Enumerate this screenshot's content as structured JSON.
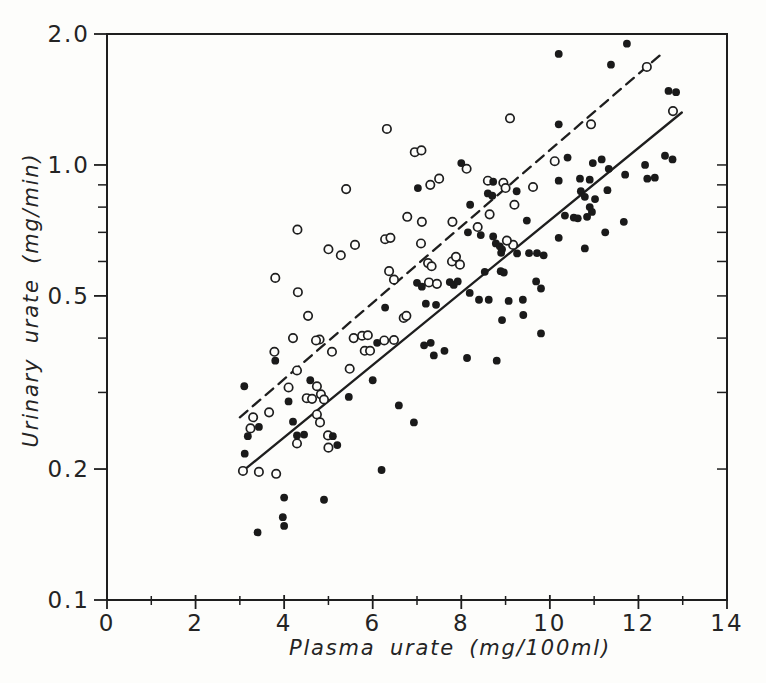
{
  "figure": {
    "background": "#fdfdfb",
    "ink": "#1e1e1e",
    "marker_fill": "#1a1a1a",
    "open_marker_fill": "#fdfdfb"
  },
  "chart_data": {
    "type": "scatter",
    "title": "",
    "xlabel": "Plasma urate (mg/100ml)",
    "ylabel": "Urinary urate (mg/min)",
    "xlim": [
      0,
      14
    ],
    "ylim": [
      0.1,
      2.0
    ],
    "y_scale": "log",
    "grid": "off",
    "legend": "none",
    "x_major_ticks": [
      {
        "value": 0,
        "label": "0"
      },
      {
        "value": 2,
        "label": "2"
      },
      {
        "value": 4,
        "label": "4"
      },
      {
        "value": 6,
        "label": "6"
      },
      {
        "value": 8,
        "label": "8"
      },
      {
        "value": 10,
        "label": "10"
      },
      {
        "value": 12,
        "label": "12"
      },
      {
        "value": 14,
        "label": "14"
      }
    ],
    "x_minor_ticks": [
      1,
      3,
      5,
      7,
      9,
      11,
      13
    ],
    "y_major_ticks": [
      {
        "value": 2.0,
        "label": "2.0"
      },
      {
        "value": 1.0,
        "label": "1.0"
      },
      {
        "value": 0.5,
        "label": "0.5"
      },
      {
        "value": 0.2,
        "label": "0.2"
      },
      {
        "value": 0.1,
        "label": "0.1"
      }
    ],
    "y_minor_ticks": [
      0.9,
      0.8,
      0.7,
      0.6,
      0.4,
      0.3
    ],
    "y_right_ticks": [
      1.0,
      0.9,
      0.8,
      0.7,
      0.6,
      0.5,
      0.4,
      0.3,
      0.2
    ],
    "lines": [
      {
        "name": "dashed-fit-line",
        "style": "dashed",
        "x1": 3.0,
        "y1": 0.263,
        "x2": 12.55,
        "y2": 1.81
      },
      {
        "name": "solid-fit-line",
        "style": "solid",
        "x1": 3.07,
        "y1": 0.198,
        "x2": 12.98,
        "y2": 1.32
      }
    ],
    "series": [
      {
        "name": "open-circles",
        "marker": "open",
        "points": [
          [
            4.3,
            0.71
          ],
          [
            3.8,
            0.55
          ],
          [
            4.31,
            0.51
          ],
          [
            4.54,
            0.45
          ],
          [
            9.1,
            1.28
          ],
          [
            6.32,
            1.21
          ],
          [
            6.95,
            1.07
          ],
          [
            7.1,
            1.08
          ],
          [
            8.12,
            0.98
          ],
          [
            7.5,
            0.93
          ],
          [
            7.3,
            0.9
          ],
          [
            5.4,
            0.88
          ],
          [
            8.6,
            0.92
          ],
          [
            8.95,
            0.91
          ],
          [
            9.0,
            0.885
          ],
          [
            9.62,
            0.89
          ],
          [
            10.11,
            1.02
          ],
          [
            10.93,
            1.24
          ],
          [
            12.19,
            1.68
          ],
          [
            12.78,
            1.33
          ],
          [
            9.2,
            0.81
          ],
          [
            6.78,
            0.76
          ],
          [
            8.64,
            0.77
          ],
          [
            7.11,
            0.74
          ],
          [
            7.8,
            0.74
          ],
          [
            8.37,
            0.72
          ],
          [
            5.0,
            0.64
          ],
          [
            5.28,
            0.62
          ],
          [
            5.6,
            0.655
          ],
          [
            6.28,
            0.675
          ],
          [
            6.4,
            0.68
          ],
          [
            7.09,
            0.66
          ],
          [
            9.17,
            0.655
          ],
          [
            9.03,
            0.67
          ],
          [
            7.79,
            0.6
          ],
          [
            7.88,
            0.615
          ],
          [
            7.97,
            0.59
          ],
          [
            7.25,
            0.595
          ],
          [
            7.33,
            0.585
          ],
          [
            6.37,
            0.57
          ],
          [
            6.48,
            0.545
          ],
          [
            7.27,
            0.537
          ],
          [
            7.45,
            0.533
          ],
          [
            6.7,
            0.445
          ],
          [
            6.76,
            0.45
          ],
          [
            5.57,
            0.4
          ],
          [
            5.76,
            0.405
          ],
          [
            5.89,
            0.406
          ],
          [
            6.26,
            0.395
          ],
          [
            6.48,
            0.396
          ],
          [
            4.8,
            0.397
          ],
          [
            5.08,
            0.372
          ],
          [
            5.82,
            0.374
          ],
          [
            5.94,
            0.374
          ],
          [
            5.48,
            0.34
          ],
          [
            4.74,
            0.31
          ],
          [
            4.83,
            0.297
          ],
          [
            4.9,
            0.289
          ],
          [
            4.74,
            0.267
          ],
          [
            4.81,
            0.256
          ],
          [
            4.99,
            0.239
          ],
          [
            5.0,
            0.224
          ],
          [
            4.2,
            0.4
          ],
          [
            4.72,
            0.395
          ],
          [
            3.78,
            0.372
          ],
          [
            4.29,
            0.337
          ],
          [
            4.1,
            0.308
          ],
          [
            4.51,
            0.291
          ],
          [
            4.63,
            0.29
          ],
          [
            3.3,
            0.263
          ],
          [
            3.66,
            0.27
          ],
          [
            3.24,
            0.248
          ],
          [
            4.29,
            0.229
          ],
          [
            3.07,
            0.198
          ],
          [
            3.43,
            0.197
          ],
          [
            3.82,
            0.195
          ]
        ]
      },
      {
        "name": "filled-circles",
        "marker": "filled",
        "points": [
          [
            10.2,
            1.8
          ],
          [
            11.74,
            1.9
          ],
          [
            11.38,
            1.7
          ],
          [
            12.68,
            1.48
          ],
          [
            12.85,
            1.47
          ],
          [
            10.2,
            1.24
          ],
          [
            8.0,
            1.01
          ],
          [
            10.4,
            1.04
          ],
          [
            10.97,
            1.01
          ],
          [
            11.17,
            1.03
          ],
          [
            11.33,
            0.98
          ],
          [
            12.15,
            1.0
          ],
          [
            12.6,
            1.05
          ],
          [
            12.77,
            1.03
          ],
          [
            11.7,
            0.95
          ],
          [
            12.2,
            0.93
          ],
          [
            12.37,
            0.935
          ],
          [
            10.68,
            0.93
          ],
          [
            10.9,
            0.925
          ],
          [
            10.2,
            0.92
          ],
          [
            8.72,
            0.915
          ],
          [
            7.02,
            0.885
          ],
          [
            9.25,
            0.87
          ],
          [
            8.6,
            0.86
          ],
          [
            8.7,
            0.85
          ],
          [
            8.2,
            0.81
          ],
          [
            10.7,
            0.87
          ],
          [
            10.79,
            0.845
          ],
          [
            11.02,
            0.835
          ],
          [
            11.3,
            0.875
          ],
          [
            10.9,
            0.8
          ],
          [
            10.95,
            0.78
          ],
          [
            10.34,
            0.765
          ],
          [
            10.54,
            0.757
          ],
          [
            10.63,
            0.754
          ],
          [
            10.84,
            0.76
          ],
          [
            9.48,
            0.745
          ],
          [
            8.15,
            0.7
          ],
          [
            8.72,
            0.685
          ],
          [
            8.44,
            0.69
          ],
          [
            8.78,
            0.66
          ],
          [
            8.87,
            0.65
          ],
          [
            8.92,
            0.64
          ],
          [
            8.9,
            0.628
          ],
          [
            9.26,
            0.626
          ],
          [
            9.53,
            0.627
          ],
          [
            9.71,
            0.627
          ],
          [
            9.86,
            0.62
          ],
          [
            10.2,
            0.68
          ],
          [
            11.25,
            0.7
          ],
          [
            11.67,
            0.74
          ],
          [
            10.79,
            0.643
          ],
          [
            8.53,
            0.568
          ],
          [
            8.89,
            0.57
          ],
          [
            8.96,
            0.566
          ],
          [
            9.69,
            0.54
          ],
          [
            9.8,
            0.52
          ],
          [
            7.0,
            0.536
          ],
          [
            7.11,
            0.525
          ],
          [
            7.74,
            0.538
          ],
          [
            7.83,
            0.53
          ],
          [
            7.92,
            0.54
          ],
          [
            8.19,
            0.508
          ],
          [
            8.4,
            0.49
          ],
          [
            8.62,
            0.49
          ],
          [
            7.2,
            0.48
          ],
          [
            7.43,
            0.477
          ],
          [
            6.28,
            0.47
          ],
          [
            9.07,
            0.487
          ],
          [
            9.39,
            0.49
          ],
          [
            9.4,
            0.452
          ],
          [
            8.92,
            0.44
          ],
          [
            9.8,
            0.41
          ],
          [
            6.1,
            0.39
          ],
          [
            7.16,
            0.385
          ],
          [
            7.31,
            0.39
          ],
          [
            7.38,
            0.365
          ],
          [
            7.62,
            0.374
          ],
          [
            8.13,
            0.36
          ],
          [
            8.8,
            0.355
          ],
          [
            6.0,
            0.32
          ],
          [
            5.46,
            0.293
          ],
          [
            6.59,
            0.28
          ],
          [
            6.93,
            0.256
          ],
          [
            5.1,
            0.238
          ],
          [
            5.2,
            0.227
          ],
          [
            6.2,
            0.199
          ],
          [
            4.9,
            0.17
          ],
          [
            4.59,
            0.32
          ],
          [
            3.1,
            0.31
          ],
          [
            4.1,
            0.286
          ],
          [
            3.8,
            0.355
          ],
          [
            3.43,
            0.25
          ],
          [
            3.18,
            0.238
          ],
          [
            4.2,
            0.257
          ],
          [
            4.29,
            0.239
          ],
          [
            4.45,
            0.24
          ],
          [
            3.11,
            0.217
          ],
          [
            4.0,
            0.172
          ],
          [
            3.97,
            0.155
          ],
          [
            4.0,
            0.148
          ],
          [
            3.4,
            0.143
          ]
        ]
      }
    ]
  }
}
